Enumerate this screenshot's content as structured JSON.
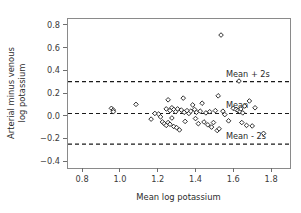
{
  "chart_data": {
    "type": "scatter",
    "title": "",
    "xlabel": "Mean log potassium",
    "ylabel": "Arterial minus venous log potassium",
    "ylabel_lines": [
      "Arterial minus venous",
      "log potassium"
    ],
    "xlim": [
      0.72,
      1.9
    ],
    "ylim": [
      -0.46,
      0.86
    ],
    "xticks": [
      0.8,
      1.0,
      1.2,
      1.4,
      1.6,
      1.8
    ],
    "xticklabels": [
      "0.8",
      "1.0",
      "1.2",
      "1.4",
      "1.6",
      "1.8"
    ],
    "yticks": [
      -0.4,
      -0.2,
      0.0,
      0.2,
      0.4,
      0.6,
      0.8
    ],
    "yticklabels": [
      "-0.4",
      "-0.2",
      "0.0",
      "0.2",
      "0.4",
      "0.6",
      "0.8"
    ],
    "grid": false,
    "legend": "none",
    "marker": "open-diamond",
    "marker_color": "#1a1a1a",
    "reference_lines": [
      {
        "label": "Mean + 2s",
        "value": 0.3,
        "style": "dashed"
      },
      {
        "label": "Mean",
        "value": 0.02,
        "style": "dashed"
      },
      {
        "label": "Mean - 2s",
        "value": -0.25,
        "style": "dashed"
      }
    ],
    "x": [
      0.955,
      0.965,
      0.965,
      1.085,
      1.165,
      1.185,
      1.205,
      1.215,
      1.225,
      1.235,
      1.245,
      1.245,
      1.255,
      1.255,
      1.265,
      1.265,
      1.275,
      1.275,
      1.285,
      1.285,
      1.295,
      1.3,
      1.305,
      1.315,
      1.325,
      1.335,
      1.34,
      1.345,
      1.355,
      1.365,
      1.375,
      1.385,
      1.395,
      1.4,
      1.405,
      1.415,
      1.425,
      1.435,
      1.445,
      1.455,
      1.465,
      1.475,
      1.485,
      1.495,
      1.505,
      1.515,
      1.52,
      1.525,
      1.535,
      1.545,
      1.555,
      1.575,
      1.6,
      1.615,
      1.625,
      1.63,
      1.635,
      1.64,
      1.645,
      1.65,
      1.66,
      1.67,
      1.685,
      1.7,
      1.715,
      1.76
    ],
    "y": [
      0.065,
      0.05,
      0.035,
      0.1,
      -0.03,
      0.02,
      0.015,
      -0.01,
      -0.055,
      -0.07,
      -0.085,
      0.06,
      0.14,
      -0.06,
      0.045,
      -0.075,
      0.07,
      -0.02,
      0.055,
      -0.095,
      0.035,
      -0.105,
      0.06,
      -0.125,
      0.05,
      0.155,
      0.03,
      -0.05,
      0.045,
      0.02,
      0.04,
      0.095,
      0.055,
      -0.025,
      0.03,
      -0.07,
      0.04,
      0.11,
      -0.055,
      0.025,
      -0.08,
      0.035,
      -0.1,
      -0.06,
      0.045,
      -0.13,
      0.175,
      -0.115,
      0.71,
      0.04,
      0.01,
      -0.045,
      0.065,
      0.055,
      0.045,
      0.305,
      0.035,
      0.06,
      -0.06,
      0.025,
      0.085,
      -0.085,
      0.13,
      -0.09,
      0.07,
      -0.155
    ]
  }
}
